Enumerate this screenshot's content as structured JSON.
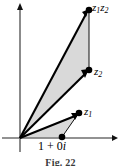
{
  "figure": {
    "caption": "Fig. 22",
    "background_color": "#ffffff",
    "stroke_color": "#000000",
    "axis_color": "#6e6e6e",
    "shade_color": "#d9d9d9"
  },
  "axes": {
    "origin": {
      "x": 20,
      "y": 138
    },
    "imaginary_axis": {
      "name": "imaginary-axis",
      "x": 20,
      "y_top": 4,
      "y_bottom": 152,
      "arrow": "up"
    },
    "real_axis": {
      "name": "real-axis",
      "y": 138,
      "x_left": 2,
      "x_right": 118,
      "arrow": "right"
    }
  },
  "points": [
    {
      "id": "origin",
      "label": "",
      "x": 20,
      "y": 138
    },
    {
      "id": "unit",
      "label": "1 + 0i",
      "label_real": "1 + 0",
      "label_imag": "i",
      "x": 62,
      "y": 137
    },
    {
      "id": "z1",
      "label": "z1",
      "base": "z",
      "subscript": "1",
      "x": 79,
      "y": 113
    },
    {
      "id": "z2",
      "label": "z2",
      "base": "z",
      "subscript": "2",
      "x": 89,
      "y": 70
    },
    {
      "id": "z1z2",
      "label": "z1z2",
      "base": "z",
      "subscript": "1",
      "base2": "z",
      "subscript2": "2",
      "x": 89,
      "y": 10
    }
  ],
  "labels": {
    "z1z2": {
      "base": "z",
      "sub1": "1",
      "base2": "z",
      "sub2": "2"
    },
    "z2": {
      "base": "z",
      "sub": "2"
    },
    "z1": {
      "base": "z",
      "sub": "1"
    },
    "unit": {
      "text": "1 + 0",
      "imaginary_unit": "i"
    }
  },
  "shapes": {
    "small_triangle": {
      "name": "triangle-origin-unit-z1",
      "vertices": [
        [
          20,
          138
        ],
        [
          62,
          137
        ],
        [
          79,
          113
        ]
      ],
      "fill": "#d9d9d9"
    },
    "large_triangle": {
      "name": "triangle-origin-z2-z1z2",
      "vertices": [
        [
          20,
          138
        ],
        [
          89,
          70
        ],
        [
          89,
          10
        ]
      ],
      "fill": "#d9d9d9"
    }
  },
  "vectors": [
    {
      "name": "vector-z1",
      "from": [
        20,
        138
      ],
      "to": [
        79,
        113
      ],
      "arrow": true
    },
    {
      "name": "vector-z2",
      "from": [
        20,
        138
      ],
      "to": [
        89,
        70
      ],
      "arrow": true
    },
    {
      "name": "vector-z1z2",
      "from": [
        20,
        138
      ],
      "to": [
        89,
        10
      ],
      "arrow": true
    }
  ],
  "connectors": [
    {
      "name": "connector-unit-to-z1",
      "from": [
        62,
        137
      ],
      "to": [
        79,
        113
      ]
    },
    {
      "name": "connector-z2-to-z1z2",
      "from": [
        89,
        70
      ],
      "to": [
        89,
        10
      ]
    }
  ]
}
